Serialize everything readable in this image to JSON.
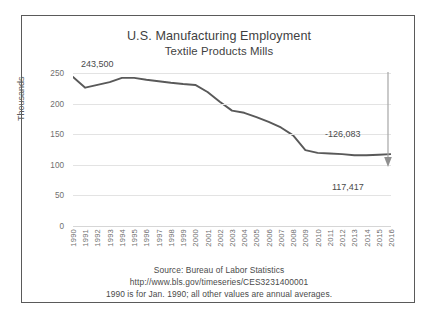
{
  "chart_data": {
    "type": "line",
    "title": "U.S. Manufacturing Employment",
    "subtitle": "Textile Products Mills",
    "xlabel": "",
    "ylabel": "Thousands",
    "ylim": [
      0,
      250
    ],
    "yticks": [
      0,
      50,
      100,
      150,
      200,
      250
    ],
    "grid": true,
    "legend": "none",
    "line_color": "#595959",
    "categories": [
      "1990",
      "1991",
      "1992",
      "1993",
      "1994",
      "1995",
      "1996",
      "1997",
      "1998",
      "1999",
      "2000",
      "2001",
      "2002",
      "2003",
      "2004",
      "2005",
      "2006",
      "2007",
      "2008",
      "2009",
      "2010",
      "2011",
      "2012",
      "2013",
      "2014",
      "2015",
      "2016"
    ],
    "values": [
      243.5,
      226.0,
      230.5,
      235.0,
      242.0,
      242.0,
      239.0,
      236.5,
      234.0,
      232.0,
      230.5,
      219.0,
      203.0,
      188.5,
      185.0,
      178.0,
      170.0,
      161.0,
      148.0,
      124.0,
      119.5,
      118.5,
      117.5,
      115.5,
      115.5,
      116.5,
      117.4
    ],
    "annotations": [
      {
        "name": "start-value",
        "text": "243,500",
        "at_category": "1990"
      },
      {
        "name": "change-value",
        "text": "-126,083"
      },
      {
        "name": "end-value",
        "text": "117,417",
        "at_category": "2016"
      }
    ]
  },
  "footnotes": {
    "source": "Source:  Bureau of Labor Statistics",
    "url": "http://www.bls.gov/timeseries/CES3231400001",
    "note": "1990 is for Jan. 1990; all other values are annual averages."
  },
  "colors": {
    "line": "#595959",
    "grid": "#e3e3e3",
    "text": "#4a4a4a",
    "frame": "#5a5a5a",
    "arrow": "#a6a6a6"
  }
}
